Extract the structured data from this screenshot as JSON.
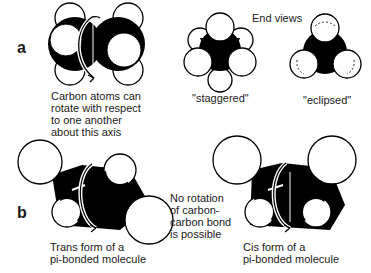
{
  "panels": {
    "a": {
      "label": "a",
      "side_view_caption": [
        "Carbon atoms can",
        "rotate with respect",
        "to one another",
        "about this axis"
      ],
      "end_views_title": "End views",
      "staggered_label": "\"staggered\"",
      "eclipsed_label": "\"eclipsed\""
    },
    "b": {
      "label": "b",
      "no_rotation_caption": [
        "No rotation",
        "of carbon-",
        "carbon bond",
        "is possible"
      ],
      "trans_caption": [
        "Trans form of a",
        "pi-bonded molecule"
      ],
      "cis_caption": [
        "Cis form of a",
        "pi-bonded molecule"
      ]
    }
  },
  "colors": {
    "atom_fill": "#ffffff",
    "carbon_fill": "#000000",
    "stroke": "#000000",
    "background": "#ffffff"
  }
}
